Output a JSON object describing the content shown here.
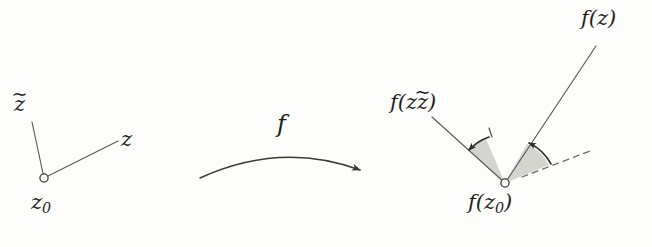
{
  "figure": {
    "background_color": "#fdfdfb",
    "ink_color": "#3a3a3a",
    "text_color": "#1e1e1e",
    "wedge_fill": "#c9c9c4",
    "width": 652,
    "height": 247
  },
  "domain_side": {
    "vertex_label": "z",
    "vertex_subscript": "0",
    "ray_labels": {
      "tilde_ray": "z",
      "tilde_accent": "~",
      "plain_ray": "z"
    },
    "vertex_point": {
      "x": 44,
      "y": 178
    },
    "tilde_ray_end": {
      "x": 32,
      "y": 122
    },
    "plain_ray_end": {
      "x": 118,
      "y": 141
    }
  },
  "map_arrow": {
    "label": "f",
    "start": {
      "x": 200,
      "y": 178
    },
    "control": {
      "x": 280,
      "y": 143
    },
    "end": {
      "x": 362,
      "y": 170
    }
  },
  "range_side": {
    "vertex_label": "f(z",
    "vertex_subscript": "0",
    "vertex_close": ")",
    "ray_labels": {
      "tilde_ray": "f(z",
      "tilde_accent": "~",
      "tilde_close": ")",
      "plain_ray": "f(z)"
    },
    "vertex_point": {
      "x": 505,
      "y": 183
    },
    "tilde_ray_end": {
      "x": 432,
      "y": 117
    },
    "plain_ray_end": {
      "x": 596,
      "y": 46
    },
    "dashed_ray_end": {
      "x": 590,
      "y": 151
    },
    "wedges": [
      {
        "name": "left-angle-wedge"
      },
      {
        "name": "right-angle-wedge"
      }
    ],
    "angle_arcs": [
      {
        "name": "left-angle-arc",
        "direction": "counterclockwise"
      },
      {
        "name": "right-angle-arc",
        "direction": "counterclockwise"
      }
    ]
  }
}
